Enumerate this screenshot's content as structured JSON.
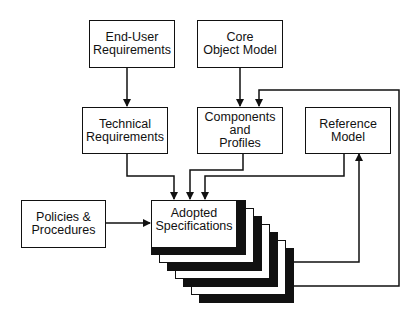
{
  "diagram": {
    "nodes": {
      "end_user": {
        "label_line1": "End-User",
        "label_line2": "Requirements"
      },
      "core_object": {
        "label_line1": "Core",
        "label_line2": "Object Model"
      },
      "technical": {
        "label_line1": "Technical",
        "label_line2": "Requirements"
      },
      "components": {
        "label_line1": "Components",
        "label_line2": "and",
        "label_line3": "Profiles"
      },
      "reference": {
        "label_line1": "Reference",
        "label_line2": "Model"
      },
      "policies": {
        "label_line1": "Policies &",
        "label_line2": "Procedures"
      },
      "adopted": {
        "label_line1": "Adopted",
        "label_line2": "Specifications"
      }
    },
    "edges": [
      {
        "from": "End-User Requirements",
        "to": "Technical Requirements"
      },
      {
        "from": "Core Object Model",
        "to": "Components and Profiles"
      },
      {
        "from": "Technical Requirements",
        "to": "Adopted Specifications"
      },
      {
        "from": "Components and Profiles",
        "to": "Adopted Specifications"
      },
      {
        "from": "Reference Model",
        "to": "Adopted Specifications"
      },
      {
        "from": "Policies & Procedures",
        "to": "Adopted Specifications"
      },
      {
        "from": "Adopted Specifications",
        "to": "Reference Model"
      },
      {
        "from": "Adopted Specifications",
        "to": "Components and Profiles"
      }
    ],
    "colors": {
      "line": "#111111",
      "background": "#ffffff"
    }
  }
}
